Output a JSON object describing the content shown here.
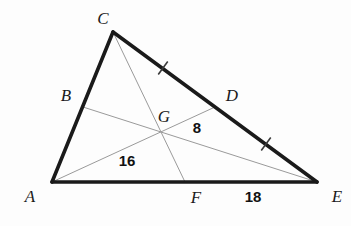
{
  "figure": {
    "background_color": "#fdfdfd",
    "outline_color": "#1a1a1a",
    "median_color": "#9a9a9a",
    "label_color": "#1a1a1a",
    "vertices": [
      {
        "id": "A",
        "label": "A",
        "x": 52,
        "y": 182,
        "label_x": 30,
        "label_y": 202
      },
      {
        "id": "C",
        "label": "C",
        "x": 113,
        "y": 32,
        "label_x": 103,
        "label_y": 24
      },
      {
        "id": "E",
        "label": "E",
        "x": 317,
        "y": 182,
        "label_x": 337,
        "label_y": 202
      }
    ],
    "midpoints": [
      {
        "id": "B",
        "label": "B",
        "x": 83,
        "y": 107,
        "label_x": 66,
        "label_y": 101,
        "on_segment": "AC"
      },
      {
        "id": "D",
        "label": "D",
        "x": 215,
        "y": 107,
        "label_x": 232,
        "label_y": 101,
        "on_segment": "CE"
      },
      {
        "id": "F",
        "label": "F",
        "x": 185,
        "y": 182,
        "label_x": 196,
        "label_y": 203,
        "on_segment": "AE"
      }
    ],
    "centroid": {
      "id": "G",
      "label": "G",
      "x": 160,
      "y": 131,
      "label_x": 164,
      "label_y": 122
    },
    "sides": [
      {
        "id": "AC",
        "from": "A",
        "to": "C"
      },
      {
        "id": "CE",
        "from": "C",
        "to": "E"
      },
      {
        "id": "AE",
        "from": "A",
        "to": "E"
      }
    ],
    "medians": [
      {
        "id": "AD",
        "from": "A",
        "to": "D"
      },
      {
        "id": "BE",
        "from": "B",
        "to": "E"
      },
      {
        "id": "CF",
        "from": "C",
        "to": "F"
      }
    ],
    "tick_marks": [
      {
        "id": "tick-CD",
        "segment": "CD",
        "x": 163,
        "y": 68
      },
      {
        "id": "tick-DE",
        "segment": "DE",
        "x": 266,
        "y": 144
      }
    ],
    "measures": [
      {
        "id": "AG",
        "text": "16",
        "x": 127,
        "y": 166,
        "segment": "AG"
      },
      {
        "id": "GD",
        "text": "8",
        "x": 197,
        "y": 133,
        "segment": "GD"
      },
      {
        "id": "FE",
        "text": "18",
        "x": 253,
        "y": 202,
        "segment": "FE"
      }
    ]
  }
}
